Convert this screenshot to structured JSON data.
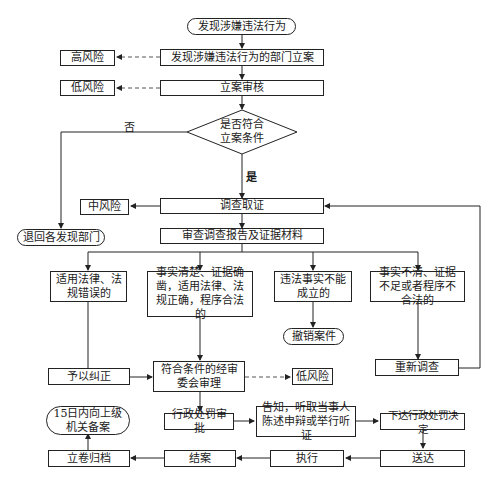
{
  "flowchart": {
    "start": "发现涉嫌违法行为",
    "dept_filing": "发现涉嫌违法行为的部门立案",
    "filing_review": "立案审核",
    "decision": "是否符合立案条件",
    "decision_line1": "是否符合",
    "decision_line2": "立案条件",
    "no_label": "否",
    "yes_label": "是",
    "risk_high": "高风险",
    "risk_low_1": "低风险",
    "risk_mid": "中风险",
    "risk_low_2": "低风险",
    "return_dept": "退回各发现部门",
    "investigate": "调查取证",
    "review_report": "审查调查报告及证据材料",
    "branches": [
      {
        "id": "law-error",
        "text": "适用法律、法规错误的"
      },
      {
        "id": "facts-clear",
        "text": "事实清楚、证据确凿，适用法律、法规正确，程序合法的"
      },
      {
        "id": "facts-not-established",
        "text": "违法事实不能成立的"
      },
      {
        "id": "facts-unclear",
        "text": "事实不清、证据不足或者程序不合法的"
      }
    ],
    "correct": "予以纠正",
    "committee_review": "符合条件的经审委会审理",
    "revoke_case": "撤销案件",
    "reinvestigate": "重新调查",
    "penalty_approval": "行政处罚审批",
    "notify_hearing": "告知，听取当事人陈述申辩或举行听证",
    "issue_decision": "下达行政处罚决定",
    "deliver": "送达",
    "execute": "执行",
    "close_case": "结案",
    "archive": "立卷归档",
    "report_superior": "15日内向上级机关备案"
  },
  "colors": {
    "line": "#222222",
    "dashed_line": "#555555",
    "background": "#ffffff"
  }
}
